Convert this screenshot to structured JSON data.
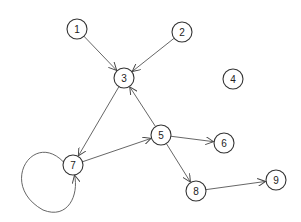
{
  "graph": {
    "directed": true,
    "node_radius": 10,
    "colors": {
      "stroke": "#333333",
      "edge": "#555555",
      "fill": "#ffffff",
      "label": "#222222"
    },
    "nodes": [
      {
        "id": "1",
        "label": "1",
        "x": 77,
        "y": 29
      },
      {
        "id": "2",
        "label": "2",
        "x": 182,
        "y": 32
      },
      {
        "id": "3",
        "label": "3",
        "x": 124,
        "y": 78
      },
      {
        "id": "4",
        "label": "4",
        "x": 233,
        "y": 79
      },
      {
        "id": "5",
        "label": "5",
        "x": 161,
        "y": 135
      },
      {
        "id": "6",
        "label": "6",
        "x": 224,
        "y": 143
      },
      {
        "id": "7",
        "label": "7",
        "x": 73,
        "y": 165
      },
      {
        "id": "8",
        "label": "8",
        "x": 196,
        "y": 191
      },
      {
        "id": "9",
        "label": "9",
        "x": 276,
        "y": 180
      }
    ],
    "edges": [
      {
        "from": "1",
        "to": "3"
      },
      {
        "from": "2",
        "to": "3"
      },
      {
        "from": "3",
        "to": "7"
      },
      {
        "from": "5",
        "to": "3"
      },
      {
        "from": "7",
        "to": "5"
      },
      {
        "from": "5",
        "to": "6"
      },
      {
        "from": "5",
        "to": "8"
      },
      {
        "from": "8",
        "to": "9"
      },
      {
        "from": "7",
        "to": "7",
        "self_loop": true
      }
    ]
  }
}
